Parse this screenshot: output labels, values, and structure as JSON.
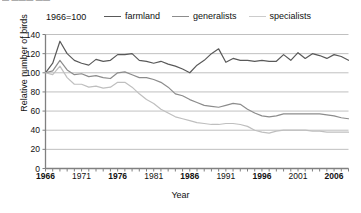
{
  "clipped_header_text": "▬ ▬▬▬ ▬▬",
  "base_note": "1966=100",
  "axis": {
    "ylabel": "Relative number of birds",
    "xlabel": "Year",
    "yticks": [
      0,
      20,
      40,
      60,
      80,
      100,
      120,
      140
    ],
    "xticks_labeled": [
      1966,
      1971,
      1976,
      1981,
      1986,
      1991,
      1996,
      2001,
      2006
    ],
    "xticks_bold": [
      1966,
      1976,
      1986,
      1996,
      2006
    ]
  },
  "legend": {
    "position": "top",
    "items": [
      {
        "label": "farmland",
        "color": "#595959"
      },
      {
        "label": "generalists",
        "color": "#8c8c8c"
      },
      {
        "label": "specialists",
        "color": "#bfbfbf"
      }
    ]
  },
  "colors": {
    "farmland": "#595959",
    "generalists": "#8c8c8c",
    "specialists": "#bfbfbf",
    "grid": "#b0b0b0",
    "axis": "#808080",
    "text": "#111111"
  },
  "chart_data": {
    "type": "line",
    "title": "",
    "subtitle": "1966=100",
    "xlabel": "Year",
    "ylabel": "Relative number of birds",
    "xlim": [
      1966,
      2008
    ],
    "ylim": [
      0,
      140
    ],
    "grid": true,
    "legend_position": "top",
    "x": [
      1966,
      1967,
      1968,
      1969,
      1970,
      1971,
      1972,
      1973,
      1974,
      1975,
      1976,
      1977,
      1978,
      1979,
      1980,
      1981,
      1982,
      1983,
      1984,
      1985,
      1986,
      1987,
      1988,
      1989,
      1990,
      1991,
      1992,
      1993,
      1994,
      1995,
      1996,
      1997,
      1998,
      1999,
      2000,
      2001,
      2002,
      2003,
      2004,
      2005,
      2006,
      2007,
      2008
    ],
    "series": [
      {
        "name": "farmland",
        "color": "#595959",
        "values": [
          100,
          110,
          133,
          120,
          113,
          110,
          108,
          114,
          112,
          113,
          119,
          119,
          120,
          113,
          112,
          110,
          112,
          109,
          107,
          104,
          100,
          108,
          113,
          120,
          125,
          111,
          115,
          113,
          113,
          112,
          113,
          112,
          112,
          119,
          113,
          121,
          115,
          120,
          118,
          115,
          119,
          117,
          113
        ]
      },
      {
        "name": "generalists",
        "color": "#8c8c8c",
        "values": [
          100,
          102,
          113,
          103,
          98,
          99,
          96,
          97,
          95,
          94,
          100,
          101,
          98,
          95,
          95,
          93,
          90,
          85,
          78,
          76,
          72,
          69,
          66,
          65,
          64,
          66,
          68,
          67,
          62,
          58,
          55,
          54,
          55,
          57,
          57,
          57,
          57,
          57,
          57,
          56,
          55,
          53,
          52
        ]
      },
      {
        "name": "specialists",
        "color": "#bfbfbf",
        "values": [
          100,
          98,
          107,
          95,
          88,
          88,
          85,
          86,
          84,
          85,
          90,
          90,
          85,
          78,
          72,
          68,
          62,
          58,
          54,
          52,
          50,
          48,
          47,
          46,
          46,
          47,
          47,
          46,
          44,
          40,
          38,
          37,
          39,
          40,
          40,
          40,
          40,
          39,
          39,
          38,
          38,
          38,
          38
        ]
      }
    ]
  }
}
